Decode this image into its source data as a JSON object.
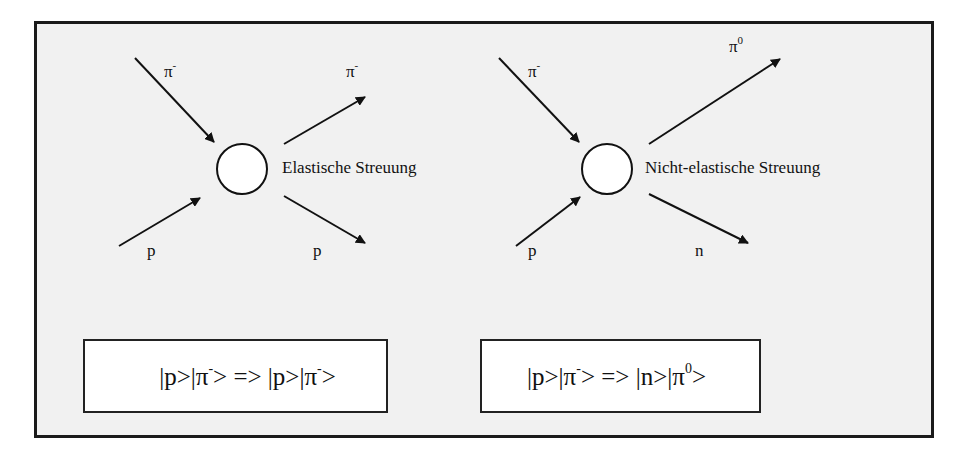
{
  "diagram": {
    "background_color": "#f1f1f1",
    "border_color": "#1a1a1a",
    "elastic": {
      "title": "Elastische Streuung",
      "incoming_top": {
        "symbol": "π",
        "sup": "-"
      },
      "incoming_bottom": {
        "symbol": "p",
        "sup": ""
      },
      "outgoing_top": {
        "symbol": "π",
        "sup": "-"
      },
      "outgoing_bottom": {
        "symbol": "p",
        "sup": ""
      },
      "formula": {
        "part1": "|p>|π",
        "sup1": "-",
        "part2": "> => |p>|π",
        "sup2": "-",
        "part3": ">"
      }
    },
    "inelastic": {
      "title": "Nicht-elastische Streuung",
      "incoming_top": {
        "symbol": "π",
        "sup": "-"
      },
      "incoming_bottom": {
        "symbol": "p",
        "sup": ""
      },
      "outgoing_top": {
        "symbol": "π",
        "sup": "0"
      },
      "outgoing_bottom": {
        "symbol": "n",
        "sup": ""
      },
      "formula": {
        "part1": "|p>|π",
        "sup1": "-",
        "part2": "> => |n>|π",
        "sup2": "0",
        "part3": ">"
      }
    }
  }
}
